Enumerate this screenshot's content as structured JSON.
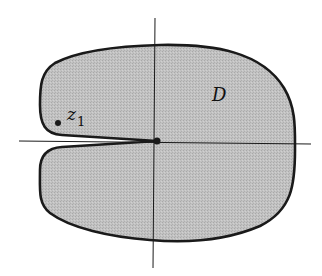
{
  "figure": {
    "region_label": "D",
    "point_label": "z",
    "point_subscript": "1",
    "colors": {
      "fill": "#bdbdbd",
      "boundary": "#1a1a1a",
      "axes": "#1a1a1a",
      "background": "#ffffff"
    }
  }
}
